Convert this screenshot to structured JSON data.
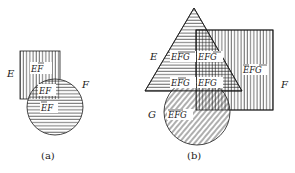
{
  "figure_a": {
    "caption": "(a)",
    "sets": {
      "E": {
        "label": "E",
        "shape": "rectangle",
        "hatch": "vertical"
      },
      "F": {
        "label": "F",
        "shape": "circle",
        "hatch": "horizontal"
      }
    },
    "regions": [
      {
        "id": "E_notF",
        "text": "EF",
        "bars": [
          "F"
        ]
      },
      {
        "id": "E_F",
        "text": "EF",
        "bars": []
      },
      {
        "id": "notE_F",
        "text": "EF",
        "bars": [
          "E"
        ]
      }
    ]
  },
  "figure_b": {
    "caption": "(b)",
    "sets": {
      "E": {
        "label": "E",
        "shape": "triangle",
        "hatch": "horizontal"
      },
      "F": {
        "label": "F",
        "shape": "rectangle",
        "hatch": "vertical"
      },
      "G": {
        "label": "G",
        "shape": "circle",
        "hatch": "diagonal"
      }
    },
    "regions": [
      {
        "id": "E_notF_notG",
        "text": "EFG",
        "bars": [
          "F",
          "G"
        ]
      },
      {
        "id": "E_F_notG",
        "text": "EFG",
        "bars": [
          "G"
        ]
      },
      {
        "id": "E_notF_G",
        "text": "EFG",
        "bars": [
          "F"
        ]
      },
      {
        "id": "E_F_G",
        "text": "EFG",
        "bars": []
      },
      {
        "id": "notE_F_notG",
        "text": "EFG",
        "bars": [
          "E",
          "G"
        ]
      },
      {
        "id": "notE_notF_G",
        "text": "EFG",
        "bars": [
          "E",
          "F"
        ]
      }
    ]
  },
  "colors": {
    "ink": "#1a1a1a",
    "background": "#ffffff"
  }
}
